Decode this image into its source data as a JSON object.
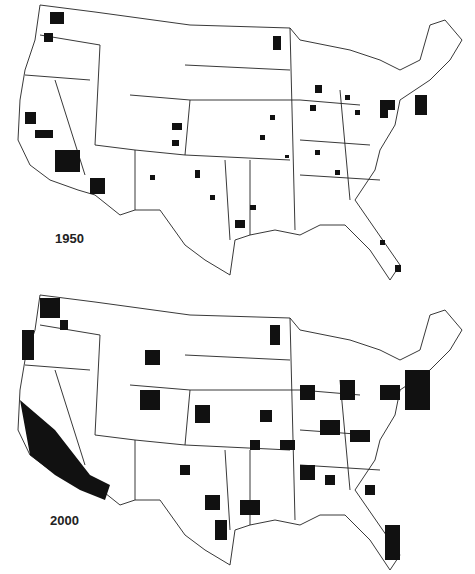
{
  "maps": [
    {
      "year_label": "1950",
      "description": "US counties shaded (1950)"
    },
    {
      "year_label": "2000",
      "description": "US counties shaded (2000)"
    }
  ],
  "colors": {
    "shaded": "#111111",
    "background": "#ffffff",
    "border": "#222222"
  }
}
